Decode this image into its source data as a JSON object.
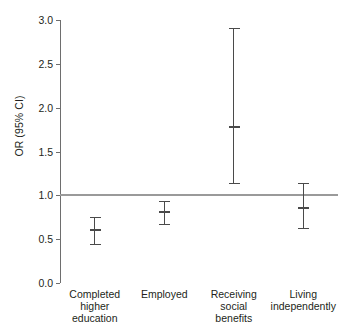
{
  "chart_data": {
    "type": "scatter",
    "title": "",
    "subtitle": "",
    "xlabel": "",
    "ylabel": "OR (95% CI)",
    "ylim": [
      0.0,
      3.0
    ],
    "yticks": [
      "0.0",
      "0.5",
      "1.0",
      "1.5",
      "2.0",
      "2.5",
      "3.0"
    ],
    "ytick_values": [
      0.0,
      0.5,
      1.0,
      1.5,
      2.0,
      2.5,
      3.0
    ],
    "grid": false,
    "legend": "none",
    "reference_line": 1.0,
    "categories": [
      "Completed higher education",
      "Employed",
      "Receiving social benefits",
      "Living independently"
    ],
    "series": [
      {
        "name": "OR (95% CI)",
        "values": [
          0.6,
          0.81,
          1.78,
          0.86
        ],
        "ci_lower": [
          0.45,
          0.67,
          1.14,
          0.63
        ],
        "ci_upper": [
          0.75,
          0.93,
          2.91,
          1.14
        ]
      }
    ],
    "points": [
      {
        "category": "Completed higher education",
        "or": 0.6,
        "ci_low": 0.45,
        "ci_high": 0.75
      },
      {
        "category": "Employed",
        "or": 0.81,
        "ci_low": 0.67,
        "ci_high": 0.93
      },
      {
        "category": "Receiving social benefits",
        "or": 1.78,
        "ci_low": 1.14,
        "ci_high": 2.91
      },
      {
        "category": "Living independently",
        "or": 0.86,
        "ci_low": 0.63,
        "ci_high": 1.14
      }
    ]
  },
  "axis": {
    "y_title": "OR (95% CI)",
    "tick_labels": [
      "3.0",
      "2.5",
      "2.0",
      "1.5",
      "1.0",
      "0.5",
      "0.0"
    ]
  },
  "x_axis": {
    "labels": [
      {
        "lines": [
          "Completed",
          "higher",
          "education"
        ]
      },
      {
        "lines": [
          "Employed"
        ]
      },
      {
        "lines": [
          "Receiving",
          "social",
          "benefits"
        ]
      },
      {
        "lines": [
          "Living",
          "independently"
        ]
      }
    ]
  },
  "colors": {
    "axis": "#6e6e6e",
    "reference_line": "#9a9a9a",
    "errorbar": "#4a4a4a",
    "text": "#231f20",
    "background": "#ffffff"
  }
}
